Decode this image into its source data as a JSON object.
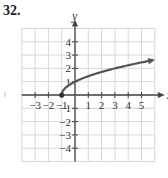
{
  "problem": {
    "number": "32."
  },
  "chart_data": {
    "type": "line",
    "title": "",
    "function": "y = sqrt(x + 1)",
    "xlabel": "x",
    "ylabel": "y",
    "xlim": [
      -4,
      6
    ],
    "ylim": [
      -5,
      5
    ],
    "grid": true,
    "x_ticks": [
      -3,
      -2,
      -1,
      1,
      2,
      3,
      4,
      5
    ],
    "x_tick_labels": [
      "−3",
      "−2",
      "−1",
      "1",
      "2",
      "3",
      "4",
      "5"
    ],
    "y_ticks": [
      4,
      3,
      2,
      1,
      -1,
      -2,
      -3,
      -4
    ],
    "y_tick_labels": [
      "4",
      "3",
      "2",
      "1",
      "−1",
      "−2",
      "−3",
      "−4"
    ],
    "series": [
      {
        "name": "y = √(x+1)",
        "color": "#555555",
        "start_point": {
          "x": -1,
          "y": 0,
          "marker": "filled-dot"
        },
        "end": "arrow",
        "points": [
          {
            "x": -1,
            "y": 0
          },
          {
            "x": -0.75,
            "y": 0.5
          },
          {
            "x": 0,
            "y": 1
          },
          {
            "x": 1,
            "y": 1.41
          },
          {
            "x": 2,
            "y": 1.73
          },
          {
            "x": 3,
            "y": 2
          },
          {
            "x": 4,
            "y": 2.24
          },
          {
            "x": 5,
            "y": 2.45
          },
          {
            "x": 5.8,
            "y": 2.6
          }
        ]
      }
    ]
  },
  "colors": {
    "grid": "#d8d8d8",
    "axis": "#444444",
    "curve": "#555555"
  }
}
